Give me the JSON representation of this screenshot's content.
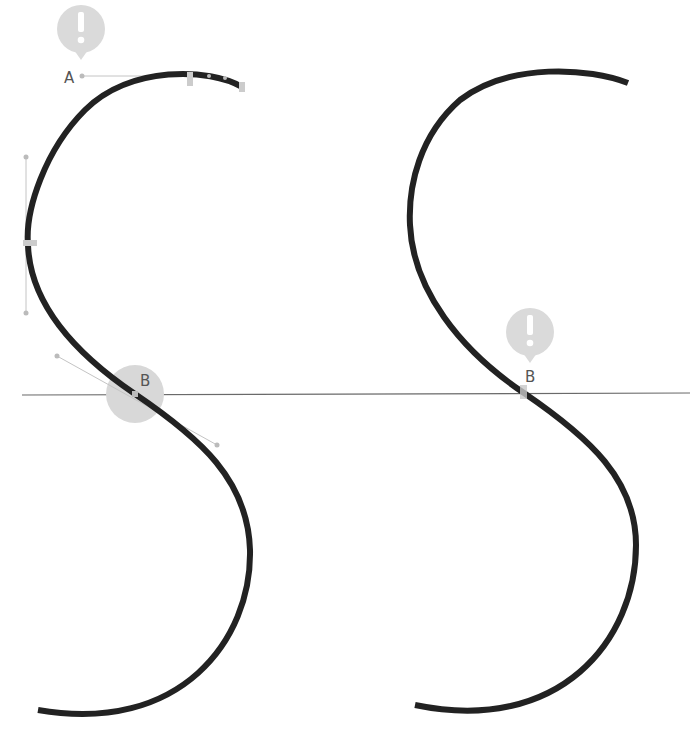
{
  "labels": {
    "left_start": "A",
    "left_inflection": "B",
    "right_inflection": "B"
  },
  "icons": {
    "warning_left": "exclamation-icon",
    "warning_right": "exclamation-icon"
  },
  "colors": {
    "curve": "#222222",
    "guide": "#666666",
    "handle": "#c8c8c8",
    "highlight": "#d6d6d6",
    "badge": "#d9d9d9"
  }
}
